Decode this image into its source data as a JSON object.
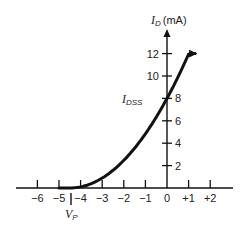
{
  "chart_data": {
    "type": "line",
    "title": "",
    "xlabel": "V_GS (V)",
    "ylabel": "I_D (mA)",
    "y_axis_title": {
      "main": "I",
      "sub": "D",
      "unit": "(mA)"
    },
    "x_ticks": [
      -6,
      -5,
      -4,
      -3,
      -2,
      -1,
      0,
      1,
      2
    ],
    "x_tick_labels": [
      "−6",
      "−5",
      "−4",
      "−3",
      "−2",
      "−1",
      "0",
      "+1",
      "+2"
    ],
    "y_ticks": [
      2,
      4,
      6,
      8,
      10,
      12
    ],
    "y_tick_labels": [
      "2",
      "4",
      "6",
      "8",
      "10",
      "12"
    ],
    "xlim": [
      -7,
      3
    ],
    "ylim": [
      0,
      14
    ],
    "grid": false,
    "legend": null,
    "annotations": [
      {
        "text_main": "I",
        "text_sub": "DSS",
        "x": -1.1,
        "y": 8,
        "note": "value of I_D at V_GS = 0"
      },
      {
        "text_main": "V",
        "text_sub": "P",
        "x": -4.5,
        "y": 0,
        "note": "pinch-off voltage marker"
      }
    ],
    "series": [
      {
        "name": "Transfer characteristic",
        "x": [
          -5.0,
          -4.5,
          -4.0,
          -3.5,
          -3.0,
          -2.5,
          -2.0,
          -1.5,
          -1.0,
          -0.5,
          0.0,
          0.5,
          1.0,
          1.3
        ],
        "values": [
          0.0,
          0.0,
          0.1,
          0.4,
          0.9,
          1.6,
          2.5,
          3.6,
          4.8,
          6.3,
          8.0,
          9.8,
          11.9,
          12.0
        ]
      }
    ],
    "parameters": {
      "IDSS_mA": 8,
      "VP_V": -4.5
    }
  }
}
